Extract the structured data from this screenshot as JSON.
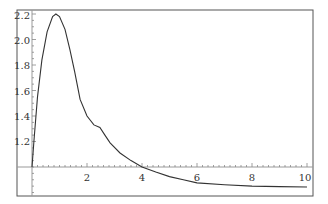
{
  "chart_data": {
    "type": "line",
    "title": "",
    "xlabel": "",
    "ylabel": "",
    "xlim": [
      0,
      10
    ],
    "ylim": [
      0.77,
      2.22
    ],
    "axes_origin": [
      0,
      1.0
    ],
    "grid": false,
    "legend": null,
    "x_ticks": [
      2,
      4,
      6,
      8,
      10
    ],
    "x_tick_labels": [
      "2",
      "4",
      "6",
      "8",
      "10"
    ],
    "y_ticks": [
      1.2,
      1.4,
      1.6,
      1.8,
      2.0,
      2.2
    ],
    "y_tick_labels": [
      "1.2",
      "1.4",
      "1.6",
      "1.8",
      "2.0",
      "2.2"
    ],
    "series": [
      {
        "name": "f(x)",
        "color": "#333333",
        "x": [
          0,
          0.07,
          0.2,
          0.36,
          0.55,
          0.75,
          0.87,
          1.0,
          1.2,
          1.38,
          1.55,
          1.75,
          2.0,
          2.25,
          2.47,
          2.65,
          2.84,
          3.2,
          3.6,
          4.0,
          4.5,
          5.0,
          5.5,
          6.0,
          7.0,
          8.0,
          9.0,
          10.0
        ],
        "y": [
          1.0,
          1.2,
          1.55,
          1.84,
          2.06,
          2.18,
          2.2,
          2.18,
          2.08,
          1.92,
          1.75,
          1.53,
          1.4,
          1.33,
          1.31,
          1.25,
          1.19,
          1.11,
          1.05,
          1.0,
          0.96,
          0.925,
          0.9,
          0.875,
          0.86,
          0.85,
          0.846,
          0.843
        ]
      }
    ]
  },
  "labels": {
    "x": [
      "2",
      "4",
      "6",
      "8",
      "10"
    ],
    "y": [
      "1.2",
      "1.4",
      "1.6",
      "1.8",
      "2.0",
      "2.2"
    ]
  }
}
